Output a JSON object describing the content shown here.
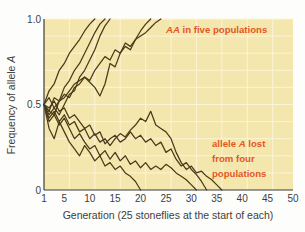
{
  "chart_data": {
    "type": "line",
    "title": "",
    "xlabel": "Generation (25 stoneflies at the start of each)",
    "ylabel": "Frequency of allele A",
    "xlim": [
      1,
      50
    ],
    "ylim": [
      0,
      1.0
    ],
    "xticks": [
      1,
      5,
      10,
      15,
      20,
      25,
      30,
      35,
      40,
      45,
      50
    ],
    "xtick_labels": [
      "1",
      "5",
      "10",
      "15",
      "20",
      "25",
      "30",
      "35",
      "40",
      "45",
      "50"
    ],
    "yticks": [
      0,
      0.5,
      1.0
    ],
    "ytick_labels": [
      "0",
      "0.5",
      "1.0"
    ],
    "grid": true,
    "grid_x_step": 5,
    "grid_y_step": 0.1,
    "legend_position": "none",
    "plot_bgcolor": "#f4e7ae",
    "grid_color": "#fbf4d7",
    "line_color": "#4a3a18",
    "annotation_color": "#e2581f",
    "annotations": [
      {
        "name": "fixed-populations-note",
        "text": "AA in five populations",
        "italic_prefix": "AA",
        "rest": " in five populations",
        "x": 24.5,
        "y": 0.95
      },
      {
        "name": "lost-populations-note",
        "lines": [
          "allele A lost",
          "from four",
          "populations"
        ],
        "line1_pre": "allele ",
        "line1_ital": "A",
        "line1_post": " lost",
        "line2": "from four",
        "line3": "populations",
        "x": 33.5,
        "y": 0.24
      }
    ],
    "series": [
      {
        "name": "population-1-fixed",
        "outcome": "fixed",
        "x": [
          1,
          2,
          3,
          4,
          5,
          6,
          7,
          8,
          9,
          10,
          11
        ],
        "values": [
          0.5,
          0.58,
          0.62,
          0.7,
          0.74,
          0.8,
          0.84,
          0.88,
          0.93,
          0.97,
          1.0
        ]
      },
      {
        "name": "population-2-fixed",
        "outcome": "fixed",
        "x": [
          1,
          2,
          3,
          4,
          5,
          6,
          7,
          8,
          9,
          10,
          11,
          12,
          13
        ],
        "values": [
          0.5,
          0.46,
          0.54,
          0.52,
          0.6,
          0.64,
          0.7,
          0.74,
          0.8,
          0.86,
          0.92,
          0.97,
          1.0
        ]
      },
      {
        "name": "population-3-fixed",
        "outcome": "fixed",
        "x": [
          1,
          2,
          3,
          4,
          5,
          6,
          7,
          8,
          9,
          10,
          11,
          12,
          13,
          14
        ],
        "values": [
          0.5,
          0.44,
          0.48,
          0.44,
          0.5,
          0.56,
          0.58,
          0.66,
          0.7,
          0.76,
          0.82,
          0.9,
          0.96,
          1.0
        ]
      },
      {
        "name": "population-4-fixed",
        "outcome": "fixed",
        "x": [
          1,
          2,
          3,
          4,
          5,
          6,
          7,
          8,
          9,
          10,
          11,
          12,
          13,
          14,
          15,
          16,
          17,
          18,
          19,
          20,
          21,
          22
        ],
        "values": [
          0.5,
          0.4,
          0.44,
          0.52,
          0.54,
          0.58,
          0.62,
          0.64,
          0.66,
          0.63,
          0.6,
          0.55,
          0.62,
          0.74,
          0.72,
          0.8,
          0.84,
          0.82,
          0.88,
          0.93,
          0.97,
          1.0
        ]
      },
      {
        "name": "population-5-fixed",
        "outcome": "fixed",
        "x": [
          1,
          2,
          3,
          4,
          5,
          6,
          7,
          8,
          9,
          10,
          11,
          12,
          13,
          14,
          15,
          16,
          17,
          18,
          19,
          20,
          21,
          22,
          23,
          24
        ],
        "values": [
          0.5,
          0.54,
          0.48,
          0.52,
          0.56,
          0.54,
          0.6,
          0.62,
          0.66,
          0.64,
          0.7,
          0.74,
          0.78,
          0.76,
          0.82,
          0.8,
          0.86,
          0.84,
          0.88,
          0.9,
          0.92,
          0.95,
          0.98,
          1.0
        ]
      },
      {
        "name": "population-6-lost",
        "outcome": "lost",
        "x": [
          1,
          2,
          3,
          4,
          5,
          6,
          7,
          8,
          9,
          10,
          11,
          12,
          13,
          14,
          15,
          16,
          17,
          18,
          19,
          20
        ],
        "values": [
          0.5,
          0.36,
          0.3,
          0.4,
          0.34,
          0.28,
          0.24,
          0.2,
          0.26,
          0.22,
          0.17,
          0.2,
          0.14,
          0.16,
          0.12,
          0.14,
          0.1,
          0.08,
          0.05,
          0.0
        ]
      },
      {
        "name": "population-7-lost",
        "outcome": "lost",
        "x": [
          1,
          2,
          3,
          4,
          5,
          6,
          7,
          8,
          9,
          10,
          11,
          12,
          13,
          14,
          15,
          16,
          17,
          18,
          19,
          20,
          21,
          22,
          23,
          24,
          25,
          26,
          27,
          28,
          29,
          30,
          31
        ],
        "values": [
          0.5,
          0.46,
          0.44,
          0.38,
          0.42,
          0.36,
          0.3,
          0.33,
          0.28,
          0.24,
          0.26,
          0.2,
          0.23,
          0.18,
          0.22,
          0.17,
          0.2,
          0.15,
          0.17,
          0.13,
          0.16,
          0.12,
          0.14,
          0.12,
          0.15,
          0.13,
          0.1,
          0.08,
          0.06,
          0.03,
          0.0
        ]
      },
      {
        "name": "population-8-lost",
        "outcome": "lost",
        "x": [
          1,
          2,
          3,
          4,
          5,
          6,
          7,
          8,
          9,
          10,
          11,
          12,
          13,
          14,
          15,
          16,
          17,
          18,
          19,
          20,
          21,
          22,
          23,
          24,
          25,
          26,
          27,
          28,
          29,
          30,
          31,
          32,
          33,
          34,
          35,
          36
        ],
        "values": [
          0.5,
          0.42,
          0.46,
          0.4,
          0.44,
          0.38,
          0.4,
          0.34,
          0.36,
          0.3,
          0.33,
          0.28,
          0.3,
          0.26,
          0.3,
          0.33,
          0.31,
          0.35,
          0.38,
          0.42,
          0.4,
          0.46,
          0.38,
          0.36,
          0.34,
          0.3,
          0.22,
          0.16,
          0.12,
          0.14,
          0.1,
          0.11,
          0.08,
          0.06,
          0.03,
          0.0
        ]
      },
      {
        "name": "population-9-lost",
        "outcome": "lost",
        "x": [
          1,
          2,
          3,
          4,
          5,
          6,
          7,
          8,
          9,
          10,
          11,
          12,
          13,
          14,
          15,
          16,
          17,
          18,
          19,
          20,
          21,
          22,
          23,
          24,
          25,
          26,
          27,
          28,
          29,
          30,
          31,
          32,
          33
        ],
        "values": [
          0.5,
          0.48,
          0.52,
          0.46,
          0.48,
          0.42,
          0.44,
          0.4,
          0.36,
          0.38,
          0.32,
          0.34,
          0.27,
          0.3,
          0.32,
          0.28,
          0.3,
          0.34,
          0.3,
          0.32,
          0.28,
          0.3,
          0.26,
          0.28,
          0.22,
          0.24,
          0.18,
          0.14,
          0.16,
          0.12,
          0.09,
          0.05,
          0.0
        ]
      }
    ]
  }
}
